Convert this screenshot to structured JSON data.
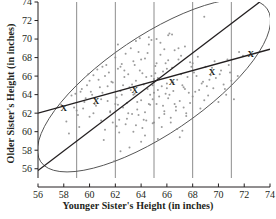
{
  "chart_data": {
    "type": "scatter",
    "title": "",
    "xlabel": "Younger Sister's Height (in inches)",
    "ylabel": "Older Sister's Height (in inches)",
    "xlim": [
      56,
      74
    ],
    "ylim": [
      55,
      74
    ],
    "xticks": [
      56,
      58,
      60,
      62,
      64,
      66,
      68,
      70,
      72,
      74
    ],
    "yticks": [
      56,
      58,
      60,
      62,
      64,
      66,
      68,
      70,
      72,
      74
    ],
    "grid": "vertical-only",
    "gridlines_x": [
      59,
      62,
      65,
      68,
      71
    ],
    "legend": "none",
    "point_color": "#8a8a8a",
    "line_color": "#231f20",
    "ellipse_color": "#555555",
    "series": [
      {
        "name": "sister height pairs",
        "marker": "dot",
        "points": [
          [
            57.8,
            62.9
          ],
          [
            58.2,
            61.1
          ],
          [
            58.4,
            59.8
          ],
          [
            58.6,
            63.9
          ],
          [
            58.9,
            64.1
          ],
          [
            59.0,
            62.3
          ],
          [
            59.2,
            60.5
          ],
          [
            59.4,
            64.6
          ],
          [
            59.6,
            63.2
          ],
          [
            59.8,
            65.0
          ],
          [
            60.0,
            61.6
          ],
          [
            60.1,
            64.3
          ],
          [
            60.3,
            66.1
          ],
          [
            60.5,
            62.8
          ],
          [
            60.7,
            65.6
          ],
          [
            60.9,
            63.5
          ],
          [
            61.0,
            67.0
          ],
          [
            61.2,
            60.2
          ],
          [
            61.4,
            64.9
          ],
          [
            61.5,
            66.4
          ],
          [
            61.6,
            62.1
          ],
          [
            61.8,
            65.3
          ],
          [
            61.9,
            56.8
          ],
          [
            62.0,
            68.0
          ],
          [
            62.1,
            63.7
          ],
          [
            62.2,
            66.8
          ],
          [
            62.3,
            61.3
          ],
          [
            62.4,
            64.4
          ],
          [
            62.5,
            67.3
          ],
          [
            62.6,
            62.6
          ],
          [
            62.7,
            65.9
          ],
          [
            62.8,
            60.8
          ],
          [
            62.9,
            63.1
          ],
          [
            63.0,
            66.2
          ],
          [
            63.1,
            64.8
          ],
          [
            63.2,
            69.0
          ],
          [
            63.3,
            61.9
          ],
          [
            63.4,
            67.6
          ],
          [
            63.5,
            64.1
          ],
          [
            63.6,
            65.5
          ],
          [
            63.7,
            62.4
          ],
          [
            63.8,
            68.6
          ],
          [
            63.9,
            66.6
          ],
          [
            64.0,
            63.4
          ],
          [
            64.1,
            60.4
          ],
          [
            64.2,
            65.1
          ],
          [
            64.3,
            67.9
          ],
          [
            64.4,
            61.2
          ],
          [
            64.5,
            64.6
          ],
          [
            64.6,
            69.4
          ],
          [
            64.7,
            62.9
          ],
          [
            64.8,
            66.0
          ],
          [
            64.9,
            60.9
          ],
          [
            65.0,
            64.2
          ],
          [
            65.1,
            67.1
          ],
          [
            65.2,
            63.0
          ],
          [
            65.3,
            65.8
          ],
          [
            65.4,
            61.5
          ],
          [
            65.5,
            68.3
          ],
          [
            65.6,
            64.9
          ],
          [
            65.7,
            66.5
          ],
          [
            65.8,
            62.2
          ],
          [
            65.9,
            67.4
          ],
          [
            66.0,
            65.2
          ],
          [
            66.1,
            63.6
          ],
          [
            66.2,
            70.6
          ],
          [
            66.3,
            61.0
          ],
          [
            66.4,
            66.9
          ],
          [
            66.5,
            64.4
          ],
          [
            66.6,
            68.8
          ],
          [
            66.7,
            62.7
          ],
          [
            66.8,
            65.6
          ],
          [
            66.9,
            67.8
          ],
          [
            67.0,
            63.3
          ],
          [
            67.1,
            66.2
          ],
          [
            67.2,
            60.1
          ],
          [
            67.3,
            64.8
          ],
          [
            67.4,
            69.2
          ],
          [
            67.5,
            62.0
          ],
          [
            67.6,
            65.9
          ],
          [
            67.8,
            67.5
          ],
          [
            68.0,
            63.8
          ],
          [
            68.1,
            66.4
          ],
          [
            68.2,
            64.3
          ],
          [
            68.4,
            68.1
          ],
          [
            68.6,
            62.5
          ],
          [
            68.8,
            65.4
          ],
          [
            69.0,
            67.0
          ],
          [
            69.2,
            63.9
          ],
          [
            69.4,
            66.1
          ],
          [
            69.6,
            64.7
          ],
          [
            69.8,
            65.8
          ],
          [
            70.0,
            63.2
          ],
          [
            70.2,
            66.6
          ],
          [
            70.4,
            65.1
          ],
          [
            70.6,
            64.0
          ],
          [
            70.8,
            67.2
          ],
          [
            71.0,
            65.5
          ],
          [
            71.2,
            63.5
          ],
          [
            71.5,
            66.0
          ],
          [
            68.9,
            72.4
          ],
          [
            66.1,
            70.4
          ],
          [
            66.4,
            70.5
          ],
          [
            65.2,
            70.0
          ],
          [
            63.6,
            69.8
          ],
          [
            61.3,
            67.2
          ],
          [
            60.6,
            66.7
          ],
          [
            59.9,
            66.2
          ],
          [
            62.2,
            69.4
          ],
          [
            64.6,
            70.2
          ],
          [
            63.1,
            58.3
          ],
          [
            62.4,
            57.9
          ],
          [
            65.3,
            59.2
          ],
          [
            67.0,
            59.4
          ],
          [
            61.1,
            59.1
          ],
          [
            64.0,
            58.9
          ],
          [
            66.8,
            60.3
          ],
          [
            63.4,
            60.0
          ],
          [
            60.2,
            64.0
          ],
          [
            59.5,
            62.5
          ],
          [
            64.3,
            62.1
          ],
          [
            65.7,
            62.8
          ],
          [
            63.8,
            61.8
          ],
          [
            62.9,
            61.4
          ],
          [
            66.6,
            63.0
          ],
          [
            64.9,
            63.5
          ],
          [
            65.9,
            64.1
          ],
          [
            63.2,
            64.5
          ],
          [
            62.6,
            65.0
          ],
          [
            61.7,
            65.4
          ],
          [
            64.4,
            65.9
          ],
          [
            65.1,
            66.3
          ],
          [
            66.0,
            66.8
          ],
          [
            67.2,
            65.0
          ],
          [
            67.7,
            64.2
          ],
          [
            64.8,
            69.9
          ],
          [
            63.9,
            70.1
          ],
          [
            65.5,
            69.6
          ],
          [
            62.8,
            68.4
          ],
          [
            61.4,
            63.3
          ],
          [
            60.8,
            64.8
          ],
          [
            59.3,
            64.3
          ],
          [
            58.8,
            62.6
          ],
          [
            68.3,
            66.0
          ],
          [
            69.1,
            64.9
          ],
          [
            70.1,
            66.2
          ],
          [
            71.6,
            68.6
          ],
          [
            66.3,
            61.5
          ],
          [
            67.5,
            61.7
          ],
          [
            65.0,
            61.0
          ],
          [
            63.0,
            62.0
          ],
          [
            64.2,
            61.3
          ],
          [
            62.3,
            59.9
          ],
          [
            61.8,
            61.0
          ],
          [
            60.4,
            63.0
          ],
          [
            64.5,
            68.5
          ],
          [
            65.8,
            68.9
          ],
          [
            66.9,
            69.0
          ],
          [
            63.5,
            67.2
          ],
          [
            62.7,
            66.6
          ],
          [
            66.2,
            64.0
          ],
          [
            67.9,
            67.0
          ],
          [
            68.7,
            65.2
          ],
          [
            69.5,
            66.9
          ],
          [
            70.9,
            66.4
          ],
          [
            64.1,
            66.3
          ],
          [
            63.3,
            65.1
          ],
          [
            62.5,
            64.0
          ],
          [
            61.0,
            64.2
          ],
          [
            60.0,
            65.5
          ],
          [
            65.4,
            63.8
          ],
          [
            66.5,
            65.3
          ],
          [
            67.4,
            64.6
          ],
          [
            68.5,
            64.5
          ],
          [
            69.3,
            65.6
          ],
          [
            64.7,
            64.0
          ],
          [
            63.7,
            63.2
          ],
          [
            62.0,
            63.0
          ],
          [
            61.6,
            62.2
          ],
          [
            59.7,
            63.6
          ],
          [
            65.6,
            60.5
          ],
          [
            66.7,
            62.3
          ],
          [
            67.8,
            63.1
          ],
          [
            68.9,
            63.4
          ],
          [
            70.5,
            64.6
          ],
          [
            64.3,
            59.6
          ],
          [
            63.6,
            60.7
          ],
          [
            62.1,
            60.6
          ],
          [
            60.9,
            61.2
          ],
          [
            59.1,
            61.8
          ],
          [
            66.1,
            67.7
          ],
          [
            65.2,
            67.4
          ],
          [
            64.0,
            67.8
          ],
          [
            62.4,
            67.0
          ],
          [
            61.2,
            66.0
          ],
          [
            67.1,
            68.2
          ],
          [
            68.0,
            67.4
          ],
          [
            69.7,
            67.6
          ],
          [
            70.7,
            67.8
          ],
          [
            71.9,
            68.2
          ],
          [
            64.9,
            65.0
          ],
          [
            65.0,
            65.7
          ],
          [
            65.3,
            64.5
          ],
          [
            66.0,
            64.7
          ],
          [
            63.4,
            64.0
          ],
          [
            62.2,
            62.9
          ],
          [
            64.6,
            63.0
          ],
          [
            65.8,
            61.9
          ],
          [
            67.3,
            62.6
          ],
          [
            60.3,
            62.0
          ]
        ]
      }
    ],
    "lines": [
      {
        "name": "regression-line",
        "style": "solid",
        "from": [
          56.0,
          62.0
        ],
        "to": [
          74.0,
          68.9
        ],
        "description": "least-squares regression of older sister's height on younger sister's height"
      },
      {
        "name": "identity-line",
        "style": "solid",
        "from": [
          56.0,
          55.8
        ],
        "to": [
          73.2,
          74.0
        ],
        "description": "line y = x"
      }
    ],
    "markers": [
      {
        "name": "x-marker-1",
        "glyph": "X",
        "x": 58.0,
        "y": 62.6
      },
      {
        "name": "x-marker-2",
        "glyph": "X",
        "x": 60.5,
        "y": 63.3
      },
      {
        "name": "x-marker-3",
        "glyph": "X",
        "x": 63.5,
        "y": 64.5
      },
      {
        "name": "x-marker-4",
        "glyph": "X",
        "x": 66.4,
        "y": 65.4
      },
      {
        "name": "x-marker-5",
        "glyph": "X",
        "x": 69.5,
        "y": 66.5
      },
      {
        "name": "x-marker-6",
        "glyph": "X",
        "x": 72.5,
        "y": 68.4
      }
    ],
    "ellipse": {
      "name": "data-concentration-ellipse",
      "center_x": 65.0,
      "center_y": 65.0,
      "semi_major": 10.6,
      "semi_minor": 5.3,
      "rotation_deg": -34
    }
  }
}
